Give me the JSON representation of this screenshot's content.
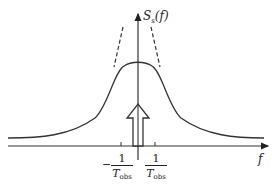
{
  "diagram": {
    "y_axis_label": "S",
    "y_axis_label_sub": "s",
    "y_axis_label_arg": "(f)",
    "x_axis_label": "f",
    "ticks": [
      {
        "sign": "−",
        "numerator": "1",
        "denominator": "T",
        "denominator_sub": "obs"
      },
      {
        "sign": "",
        "numerator": "1",
        "denominator": "T",
        "denominator_sub": "obs"
      }
    ],
    "elements": [
      "lorentzian-spectrum-curve",
      "dashed-narrow-peak",
      "hollow-up-arrow-delta"
    ],
    "colors": {
      "stroke": "#222222",
      "background": "#ffffff"
    }
  }
}
